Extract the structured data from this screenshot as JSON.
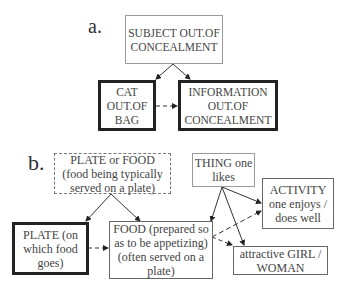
{
  "panel_a": {
    "label": "a.",
    "nodes": {
      "subject": "SUBJECT OUT.OF\nCONCEALMENT",
      "cat": "CAT\nOUT.OF\nBAG",
      "information": "INFORMATION\nOUT.OF\nCONCEALMENT"
    },
    "edges": [
      {
        "from": "subject",
        "to": "cat",
        "style": "solid"
      },
      {
        "from": "subject",
        "to": "information",
        "style": "solid"
      },
      {
        "from": "cat",
        "to": "information",
        "style": "dashed"
      }
    ]
  },
  "panel_b": {
    "label": "b.",
    "nodes": {
      "plate_or_food": "PLATE  or FOOD\n(food being typically\nserved on a plate)",
      "thing": "THING one\nlikes",
      "plate": "PLATE (on\nwhich food\ngoes)",
      "food": "FOOD (prepared so\nas to be appetizing)\n(often served on a\nplate)",
      "activity": "ACTIVITY\none enjoys /\ndoes well",
      "girl": "attractive GIRL /\nWOMAN"
    },
    "edges": [
      {
        "from": "plate_or_food",
        "to": "plate",
        "style": "solid"
      },
      {
        "from": "plate_or_food",
        "to": "food",
        "style": "solid"
      },
      {
        "from": "plate",
        "to": "food",
        "style": "dashed"
      },
      {
        "from": "thing",
        "to": "food",
        "style": "solid"
      },
      {
        "from": "thing",
        "to": "activity",
        "style": "solid"
      },
      {
        "from": "thing",
        "to": "girl",
        "style": "solid"
      },
      {
        "from": "food",
        "to": "activity",
        "style": "dashed"
      },
      {
        "from": "food",
        "to": "girl",
        "style": "dashed"
      }
    ]
  }
}
